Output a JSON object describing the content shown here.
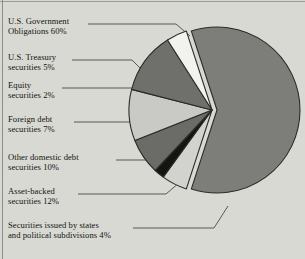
{
  "chart_data": {
    "type": "pie",
    "title": "",
    "xlabel": "",
    "ylabel": "",
    "legend_position": "callout-labels-left",
    "grid": false,
    "unit": "percent",
    "categories": [
      "U.S. Government Obligations",
      "U.S. Treasury securities",
      "Equity securities",
      "Foreign debt securities",
      "Other domestic debt securities",
      "Asset-backed securities",
      "Securities issued by states and political subdivisions"
    ],
    "values": [
      60,
      5,
      2,
      7,
      10,
      12,
      4
    ],
    "slice_colors": [
      "#7d7d7a",
      "#d2d2ce",
      "#141412",
      "#6b6b68",
      "#c9c9c5",
      "#6f6f6c",
      "#f2f2ee"
    ],
    "slices": [
      {
        "label": "U.S. Government Obligations",
        "value": 60,
        "color": "#7d7d7a"
      },
      {
        "label": "U.S. Treasury securities",
        "value": 5,
        "color": "#d2d2ce"
      },
      {
        "label": "Equity securities",
        "value": 2,
        "color": "#141412"
      },
      {
        "label": "Foreign debt securities",
        "value": 7,
        "color": "#6b6b68"
      },
      {
        "label": "Other domestic debt securities",
        "value": 10,
        "color": "#c9c9c5"
      },
      {
        "label": "Asset-backed securities",
        "value": 12,
        "color": "#6f6f6c"
      },
      {
        "label": "Securities issued by states and political subdivisions",
        "value": 4,
        "color": "#f2f2ee"
      }
    ]
  },
  "callouts": [
    {
      "line1": "U.S. Government",
      "line2": "Obligations 60%"
    },
    {
      "line1": "U.S. Treasury",
      "line2": "securities 5%"
    },
    {
      "line1": "Equity",
      "line2": "securities 2%"
    },
    {
      "line1": "Foreign debt",
      "line2": "securities 7%"
    },
    {
      "line1": "Other domestic debt",
      "line2": "securities 10%"
    },
    {
      "line1": "Asset-backed",
      "line2": "securities 12%"
    },
    {
      "line1": "Securities issued by states",
      "line2": "and political subdivisions 4%"
    }
  ],
  "colors": {
    "background": "#d9d9d4",
    "outline": "#2b2b28",
    "text": "#13130f",
    "leader": "#4a4a46"
  }
}
